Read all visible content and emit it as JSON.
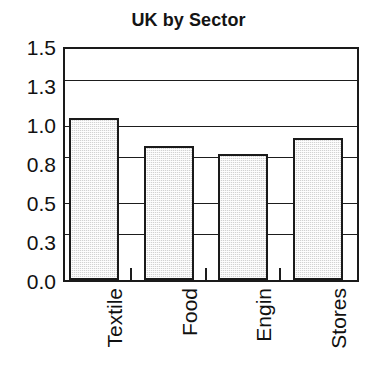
{
  "chart_data": {
    "type": "bar",
    "title": "UK by Sector",
    "xlabel": "",
    "ylabel": "",
    "categories": [
      "Textile",
      "Food",
      "Engin",
      "Stores"
    ],
    "values": [
      1.05,
      0.87,
      0.82,
      0.92
    ],
    "ylim": [
      0.0,
      1.5
    ],
    "ytick_values": [
      0.0,
      0.3,
      0.5,
      0.8,
      1.0,
      1.3,
      1.5
    ],
    "ytick_labels": [
      "0.0",
      "0.3",
      "0.5",
      "0.8",
      "1.0",
      "1.3",
      "1.5"
    ],
    "grid": true,
    "legend": false,
    "legend_position": "none",
    "bar_fill_color": "#d2d2d2",
    "bar_edge_color": "#1a1a1a",
    "axis_color": "#1a1a1a",
    "background_color": "#ffffff",
    "xtick_label_rotation": 90
  }
}
